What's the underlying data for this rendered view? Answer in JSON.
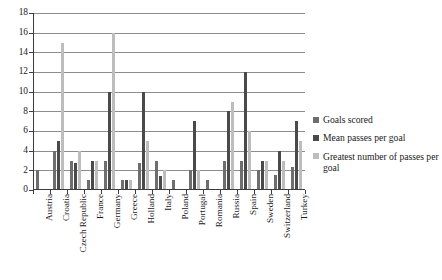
{
  "chart_data": {
    "type": "bar",
    "title": "",
    "subtitle": "",
    "xlabel": "",
    "ylabel": "",
    "ylim": [
      0,
      18
    ],
    "ytick_step": 2,
    "yticks": [
      0,
      2,
      4,
      6,
      8,
      10,
      12,
      14,
      16,
      18
    ],
    "grid": true,
    "legend_position": "right",
    "categories": [
      "Austria",
      "Croatia",
      "Czech Republic",
      "France",
      "Germany",
      "Greece",
      "Holland",
      "Italy",
      "Poland",
      "Portugal",
      "Romania",
      "Russia",
      "Spain",
      "Sweden",
      "Switzerland",
      "Turkey"
    ],
    "series": [
      {
        "name": "Goals scored",
        "color": "#6e6e6e",
        "values": [
          2,
          4,
          3,
          1,
          3,
          1,
          2.7,
          3,
          1,
          2,
          1,
          3,
          2.9,
          2,
          1.5,
          2.3
        ]
      },
      {
        "name": "Mean passes per goal",
        "color": "#4a4a4a",
        "values": [
          0,
          5,
          2.7,
          3,
          10,
          1,
          10,
          1.4,
          0,
          7,
          0,
          8,
          12,
          3,
          4,
          7
        ]
      },
      {
        "name": "Greatest number of passes per goal",
        "color": "#bdbdbd",
        "values": [
          0,
          15,
          4,
          3,
          16,
          1,
          5,
          2,
          0,
          2,
          0,
          9,
          6,
          3,
          3,
          5
        ]
      }
    ]
  },
  "legend": {
    "items": [
      {
        "label": "Goals scored",
        "color": "#6e6e6e"
      },
      {
        "label": "Mean passes per goal",
        "color": "#4a4a4a"
      },
      {
        "label": "Greatest number of passes per goal",
        "color": "#bdbdbd"
      }
    ]
  },
  "colors": {
    "axis": "#3d3d3d",
    "gridline": "#8d8d8d",
    "background": "#ffffff",
    "text": "#1a1a1a"
  }
}
